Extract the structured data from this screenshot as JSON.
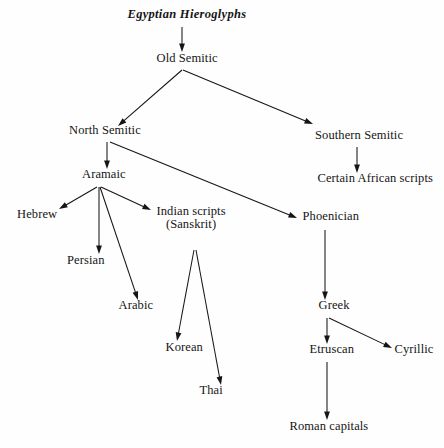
{
  "diagram": {
    "canvas": {
      "width": 444,
      "height": 448
    },
    "background_color": "#fefefe",
    "ink_color": "#151515",
    "nodes": [
      {
        "id": "egyptian",
        "label": "Egyptian Hieroglyphs",
        "label2": "",
        "x": 187,
        "y": 18,
        "style": "italic"
      },
      {
        "id": "old_semitic",
        "label": "Old Semitic",
        "label2": "",
        "x": 187,
        "y": 62,
        "style": "regular"
      },
      {
        "id": "north_semitic",
        "label": "North Semitic",
        "label2": "",
        "x": 105,
        "y": 134,
        "style": "regular"
      },
      {
        "id": "southern_semitic",
        "label": "Southern Semitic",
        "label2": "",
        "x": 359,
        "y": 139,
        "style": "regular"
      },
      {
        "id": "aramaic",
        "label": "Aramaic",
        "label2": "",
        "x": 104,
        "y": 178,
        "style": "regular"
      },
      {
        "id": "african",
        "label": "Certain African scripts",
        "label2": "",
        "x": 375,
        "y": 182,
        "style": "regular"
      },
      {
        "id": "hebrew",
        "label": "Hebrew",
        "label2": "",
        "x": 37,
        "y": 218,
        "style": "regular"
      },
      {
        "id": "indian",
        "label": "Indian scripts",
        "label2": "(Sanskrit)",
        "x": 191,
        "y": 218,
        "style": "regular"
      },
      {
        "id": "phoenician",
        "label": "Phoenician",
        "label2": "",
        "x": 331,
        "y": 220,
        "style": "regular"
      },
      {
        "id": "persian",
        "label": "Persian",
        "label2": "",
        "x": 86,
        "y": 264,
        "style": "regular"
      },
      {
        "id": "arabic",
        "label": "Arabic",
        "label2": "",
        "x": 136,
        "y": 309,
        "style": "regular"
      },
      {
        "id": "greek",
        "label": "Greek",
        "label2": "",
        "x": 334,
        "y": 309,
        "style": "regular"
      },
      {
        "id": "korean",
        "label": "Korean",
        "label2": "",
        "x": 184,
        "y": 351,
        "style": "regular"
      },
      {
        "id": "etruscan",
        "label": "Etruscan",
        "label2": "",
        "x": 332,
        "y": 353,
        "style": "regular"
      },
      {
        "id": "cyrillic",
        "label": "Cyrillic",
        "label2": "",
        "x": 414,
        "y": 353,
        "style": "regular"
      },
      {
        "id": "thai",
        "label": "Thai",
        "label2": "",
        "x": 211,
        "y": 394,
        "style": "regular"
      },
      {
        "id": "roman",
        "label": "Roman capitals",
        "label2": "",
        "x": 329,
        "y": 430,
        "style": "regular"
      }
    ],
    "edges": [
      {
        "from": "egyptian",
        "to": "old_semitic",
        "x1": 182,
        "y1": 27,
        "x2": 182,
        "y2": 52
      },
      {
        "from": "old_semitic",
        "to": "north_semitic",
        "x1": 182,
        "y1": 70,
        "x2": 118,
        "y2": 126
      },
      {
        "from": "old_semitic",
        "to": "southern_semitic",
        "x1": 183,
        "y1": 70,
        "x2": 313,
        "y2": 124
      },
      {
        "from": "north_semitic",
        "to": "aramaic",
        "x1": 107,
        "y1": 142,
        "x2": 107,
        "y2": 169
      },
      {
        "from": "north_semitic",
        "to": "phoenician",
        "x1": 110,
        "y1": 142,
        "x2": 297,
        "y2": 218
      },
      {
        "from": "southern_semitic",
        "to": "african",
        "x1": 357,
        "y1": 147,
        "x2": 357,
        "y2": 173
      },
      {
        "from": "aramaic",
        "to": "hebrew",
        "x1": 97,
        "y1": 187,
        "x2": 59,
        "y2": 209
      },
      {
        "from": "aramaic",
        "to": "persian",
        "x1": 99,
        "y1": 187,
        "x2": 99,
        "y2": 254
      },
      {
        "from": "aramaic",
        "to": "arabic",
        "x1": 100,
        "y1": 187,
        "x2": 138,
        "y2": 300
      },
      {
        "from": "aramaic",
        "to": "indian",
        "x1": 101,
        "y1": 187,
        "x2": 151,
        "y2": 210
      },
      {
        "from": "indian",
        "to": "korean",
        "x1": 194,
        "y1": 250,
        "x2": 177,
        "y2": 341
      },
      {
        "from": "indian",
        "to": "thai",
        "x1": 196,
        "y1": 250,
        "x2": 221,
        "y2": 385
      },
      {
        "from": "phoenician",
        "to": "greek",
        "x1": 325,
        "y1": 230,
        "x2": 325,
        "y2": 300
      },
      {
        "from": "greek",
        "to": "etruscan",
        "x1": 327,
        "y1": 318,
        "x2": 327,
        "y2": 344
      },
      {
        "from": "greek",
        "to": "cyrillic",
        "x1": 329,
        "y1": 318,
        "x2": 392,
        "y2": 348
      },
      {
        "from": "etruscan",
        "to": "roman",
        "x1": 327,
        "y1": 362,
        "x2": 327,
        "y2": 420
      }
    ]
  }
}
